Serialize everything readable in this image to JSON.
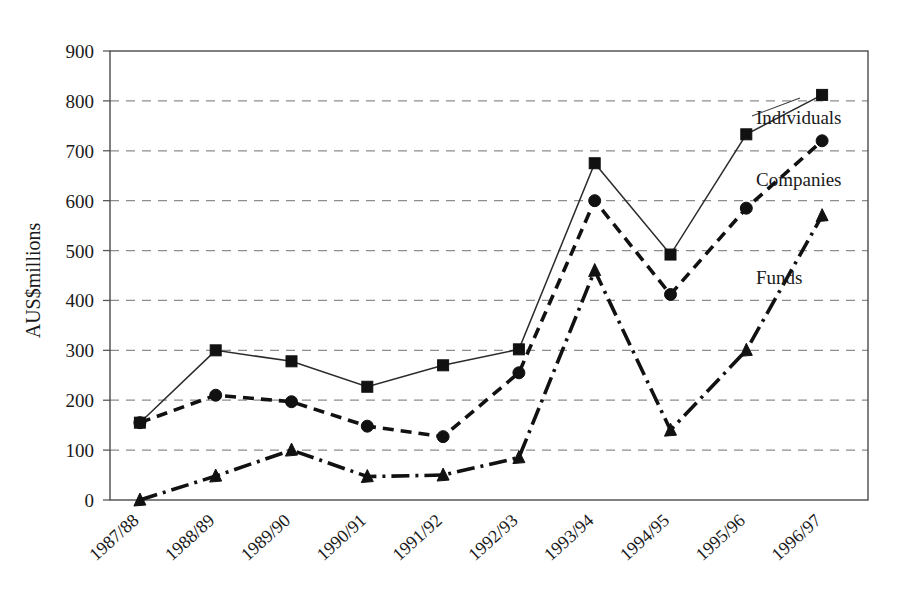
{
  "chart_data": {
    "type": "line",
    "title": "",
    "subtitle": "",
    "xlabel": "",
    "ylabel": "AUS$millions",
    "categories": [
      "1987/88",
      "1988/89",
      "1989/90",
      "1990/91",
      "1991/92",
      "1992/93",
      "1993/94",
      "1994/95",
      "1995/96",
      "1996/97"
    ],
    "ylim": [
      0,
      900
    ],
    "ytick_step": 100,
    "yticks": [
      "0",
      "100",
      "200",
      "300",
      "400",
      "500",
      "600",
      "700",
      "800",
      "900"
    ],
    "grid": "horizontal dashed gridlines only",
    "legend_position": "inline labels at right of plot near series ends",
    "series": [
      {
        "name": "Individuals",
        "marker": "square",
        "linestyle": "solid",
        "values": [
          155,
          300,
          278,
          227,
          270,
          302,
          675,
          492,
          733,
          812
        ]
      },
      {
        "name": "Companies",
        "marker": "circle",
        "linestyle": "dashed",
        "values": [
          155,
          210,
          197,
          148,
          127,
          255,
          600,
          412,
          585,
          720
        ]
      },
      {
        "name": "Funds",
        "marker": "triangle",
        "linestyle": "dash-dot",
        "values": [
          0,
          48,
          100,
          47,
          50,
          85,
          460,
          140,
          300,
          570
        ]
      }
    ],
    "annotations": [
      {
        "text": "Individuals",
        "points_to_series": "Individuals"
      },
      {
        "text": "Companies",
        "points_to_series": "Companies"
      },
      {
        "text": "Funds",
        "points_to_series": "Funds"
      }
    ]
  },
  "colors": {
    "ink": "#111111",
    "grid": "#8d8d8d",
    "frame": "#4a4a4a",
    "background": "#ffffff"
  }
}
